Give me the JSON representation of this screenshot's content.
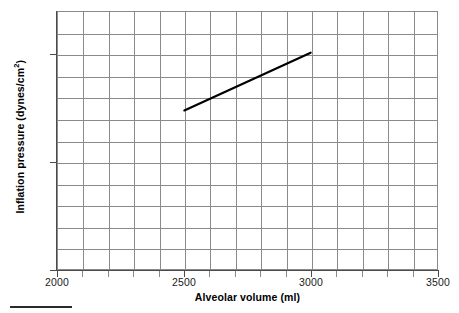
{
  "chart_data": {
    "type": "line",
    "title": "",
    "xlabel": "Alveolar volume (ml)",
    "ylabel_text": "Inflation pressure (dynes/cm",
    "ylabel_sup": "2",
    "ylabel_tail": ")",
    "ylabel_full": "Inflation pressure (dynes/cm²)",
    "xlim": [
      2000,
      3500
    ],
    "ylim": [
      0,
      12000
    ],
    "x_ticklabels": [
      "2000",
      "2500",
      "3000",
      "3500"
    ],
    "x_tickvalues": [
      2000,
      2500,
      3000,
      3500
    ],
    "y_ticklabels": [
      "0",
      "5000",
      "10000"
    ],
    "y_tickvalues": [
      0,
      5000,
      10000
    ],
    "x_minor_step": 100,
    "y_minor_step": 1000,
    "grid": true,
    "legend": "none",
    "series": [
      {
        "name": "Inflation pressure",
        "color": "#000000",
        "x": [
          2500,
          3000
        ],
        "values": [
          7400,
          10100
        ]
      }
    ]
  },
  "axes": {
    "grid_color": "#8a8a8a",
    "axis_color": "#4a4a4a",
    "line_color": "#000000",
    "background": "#ffffff"
  }
}
